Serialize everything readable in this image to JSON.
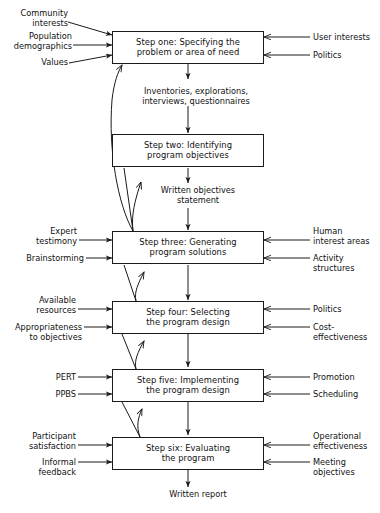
{
  "diagram": {
    "line_color": "#1a1a1a",
    "box_fill": "#ffffff",
    "steps": [
      {
        "id": "step-one",
        "text": "Step one: Specifying the\nproblem or area of need",
        "inputs_left": [
          "Community\ninterests",
          "Population\ndemographics",
          "Values"
        ],
        "inputs_right": [
          "User interests",
          "Politics"
        ]
      },
      {
        "id": "step-two",
        "text": "Step two: Identifying\nprogram objectives",
        "inputs_left": [],
        "inputs_right": []
      },
      {
        "id": "step-three",
        "text": "Step three: Generating\nprogram solutions",
        "inputs_left": [
          "Expert\ntestimony",
          "Brainstorming"
        ],
        "inputs_right": [
          "Human\ninterest areas",
          "Activity\nstructures"
        ]
      },
      {
        "id": "step-four",
        "text": "Step four: Selecting\nthe program design",
        "inputs_left": [
          "Available\nresources",
          "Appropriateness\nto objectives"
        ],
        "inputs_right": [
          "Politics",
          "Cost-\neffectiveness"
        ]
      },
      {
        "id": "step-five",
        "text": "Step five: Implementing\nthe program design",
        "inputs_left": [
          "PERT",
          "PPBS"
        ],
        "inputs_right": [
          "Promotion",
          "Scheduling"
        ]
      },
      {
        "id": "step-six",
        "text": "Step six: Evaluating\nthe program",
        "inputs_left": [
          "Participant\nsatisfaction",
          "Informal\nfeedback"
        ],
        "inputs_right": [
          "Operational\neffectiveness",
          "Meeting\nobjectives"
        ]
      }
    ],
    "connectors": [
      {
        "id": "connector-one-two",
        "text": "Inventories, explorations,\ninterviews, questionnaires"
      },
      {
        "id": "connector-two-three",
        "text": "Written objectives\nstatement"
      },
      {
        "id": "connector-six-output",
        "text": "Written report"
      }
    ]
  }
}
